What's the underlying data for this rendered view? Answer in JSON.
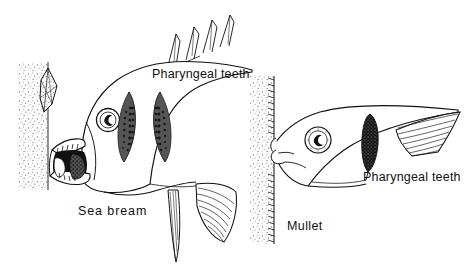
{
  "figure": {
    "background_color": "#ffffff",
    "ink_color": "#111111",
    "bone_fill_color": "#555555",
    "dark_fill_color": "#111111",
    "stipple_color": "#6a6a6a"
  },
  "labels": {
    "pharyngeal_teeth_bream": "Pharyngeal teeth",
    "sea_bream": "Sea bream",
    "mullet": "Mullet",
    "pharyngeal_teeth_mullet": "Pharyngeal teeth"
  },
  "specimens": [
    {
      "name": "Sea bream",
      "label": "Sea bream",
      "position": "left",
      "feature_label": "Pharyngeal teeth",
      "parts": [
        "body-outline",
        "open-mouth",
        "jaw-teeth",
        "eye",
        "dorsal-spines",
        "pectoral-fin",
        "pelvic-fin",
        "pharyngeal-bone-left",
        "pharyngeal-bone-right"
      ],
      "dorsal_spine_count": 4
    },
    {
      "name": "Mullet",
      "label": "Mullet",
      "position": "right",
      "feature_label": "Pharyngeal teeth",
      "parts": [
        "body-outline",
        "snout",
        "eye",
        "pharyngeal-teeth-strip",
        "gill-raker-fan"
      ]
    }
  ],
  "substrates": [
    {
      "name": "left-substrate-column",
      "has_shell": true
    },
    {
      "name": "right-substrate-column",
      "has_shell": false,
      "fringed_edge": true
    }
  ]
}
